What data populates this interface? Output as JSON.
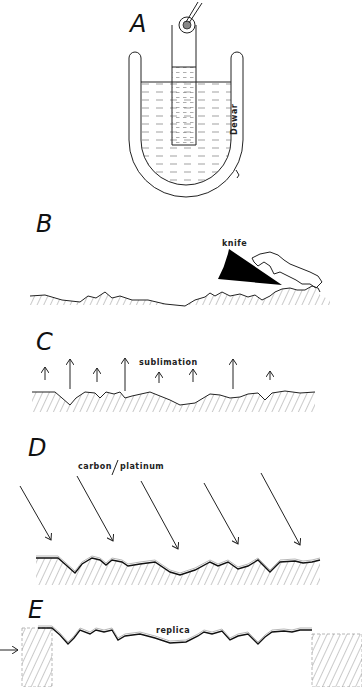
{
  "figure": {
    "panels": [
      {
        "id": "A",
        "label": "A",
        "annotations": [
          "Dewar"
        ]
      },
      {
        "id": "B",
        "label": "B",
        "annotations": [
          "knife"
        ]
      },
      {
        "id": "C",
        "label": "C",
        "annotations": [
          "sublimation"
        ]
      },
      {
        "id": "D",
        "label": "D",
        "annotations": [
          "carbon",
          "platinum"
        ]
      },
      {
        "id": "E",
        "label": "E",
        "annotations": [
          "replica"
        ]
      }
    ]
  },
  "labels": {
    "a": "A",
    "b": "B",
    "c": "C",
    "d": "D",
    "e": "E",
    "dewar": "Dewar",
    "knife": "knife",
    "sublimation": "sublimation",
    "carbon": "carbon",
    "platinum": "platinum",
    "replica": "replica"
  },
  "colors": {
    "ink": "#222222",
    "background": "#ffffff"
  }
}
